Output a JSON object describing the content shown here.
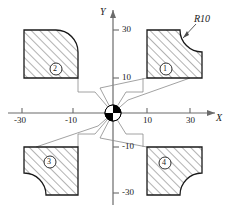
{
  "figure": {
    "title": "",
    "axes": {
      "x": {
        "name": "X",
        "ticks": [
          {
            "value": -30,
            "label": "-30"
          },
          {
            "value": -10,
            "label": "-10"
          },
          {
            "value": 10,
            "label": "10"
          },
          {
            "value": 30,
            "label": "30"
          }
        ]
      },
      "y": {
        "name": "Y",
        "ticks": [
          {
            "value": 30,
            "label": "30"
          },
          {
            "value": 10,
            "label": "10"
          },
          {
            "value": -10,
            "label": "-10"
          },
          {
            "value": -30,
            "label": "-30"
          }
        ]
      }
    },
    "annotations": [
      {
        "name": "radius-callout",
        "label": "R10",
        "target_quadrant": 1
      }
    ],
    "shapes": [
      {
        "id": 1,
        "label": "1",
        "quadrant": "upper-right",
        "x_range": [
          10,
          30
        ],
        "y_range": [
          10,
          30
        ],
        "fillet_radius": 10,
        "fillet_corner": "top-right",
        "hatched": true
      },
      {
        "id": 2,
        "label": "2",
        "quadrant": "upper-left",
        "x_range": [
          -30,
          -10
        ],
        "y_range": [
          10,
          30
        ],
        "fillet_radius": 10,
        "fillet_corner": "top-left",
        "hatched": true
      },
      {
        "id": 3,
        "label": "3",
        "quadrant": "lower-left",
        "x_range": [
          -30,
          -10
        ],
        "y_range": [
          -30,
          -10
        ],
        "fillet_radius": 10,
        "fillet_corner": "bottom-left",
        "hatched": true
      },
      {
        "id": 4,
        "label": "4",
        "quadrant": "lower-right",
        "x_range": [
          10,
          30
        ],
        "y_range": [
          -30,
          -10
        ],
        "fillet_radius": 10,
        "fillet_corner": "bottom-right",
        "hatched": true
      }
    ],
    "center_marker": {
      "name": "origin-pie-marker",
      "radius_px": 8,
      "pattern": "alternating-quadrants",
      "fill_dark": "#000000",
      "fill_light": "#ffffff"
    },
    "leader_lines": {
      "count": 8,
      "description": "radiate from origin marker to inner corners of each hatched shape"
    },
    "colors": {
      "outline": "#1a1a1a",
      "hatch": "#555555",
      "axis": "#6b6b6b",
      "leader": "#7a7a7a",
      "background": "#ffffff"
    }
  }
}
